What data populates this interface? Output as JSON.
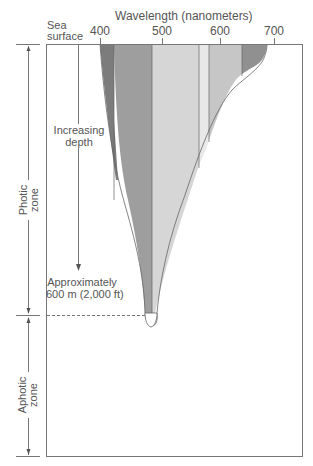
{
  "title": "Wavelength (nanometers)",
  "sea_surface_label": [
    "Sea",
    "surface"
  ],
  "wavelength_ticks": [
    "400",
    "500",
    "600",
    "700"
  ],
  "depth_arrow_label": [
    "Increasing",
    "depth"
  ],
  "depth_limit_label": [
    "Approximately",
    "600 m (2,000 ft)"
  ],
  "zones": [
    {
      "name": "photic",
      "label": [
        "Photic",
        "zone"
      ]
    },
    {
      "name": "aphotic",
      "label": [
        "Aphotic",
        "zone"
      ]
    }
  ],
  "bands": [
    {
      "name": "violet",
      "color": "#7a7a7a"
    },
    {
      "name": "blue",
      "color": "#9c9c9c"
    },
    {
      "name": "green",
      "color": "#d4d4d4"
    },
    {
      "name": "yellow",
      "color": "#e6e6e6"
    },
    {
      "name": "orange",
      "color": "#c4c4c4"
    },
    {
      "name": "red",
      "color": "#8f8f8f"
    }
  ]
}
